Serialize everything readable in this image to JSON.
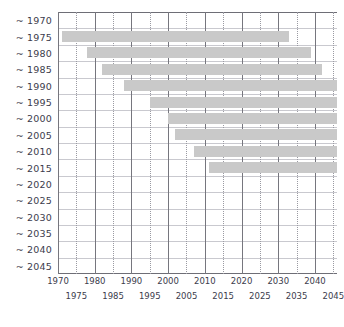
{
  "chart_data": {
    "type": "bar",
    "orientation": "horizontal",
    "title": "",
    "subtitle": "",
    "xlabel": "",
    "ylabel": "",
    "xlim": [
      1970,
      2046
    ],
    "grid": {
      "vertical_major_every": 10,
      "vertical_minor_every": 5,
      "horizontal": true
    },
    "legend": null,
    "bar_color": "#c9c9c9",
    "axis_color": "#6e6e76",
    "gridline_major_color": "#76767e",
    "gridline_minor_color": "#9a9aa2",
    "gridline_horizontal_color": "#c9c9cf",
    "categories": [
      "~ 1970",
      "~ 1975",
      "~ 1980",
      "~ 1985",
      "~ 1990",
      "~ 1995",
      "~ 2000",
      "~ 2005",
      "~ 2010",
      "~ 2015",
      "~ 2020",
      "~ 2025",
      "~ 2030",
      "~ 2035",
      "~ 2040",
      "~ 2045"
    ],
    "category_tilde_prefix": "~",
    "bars": [
      {
        "category": "~ 1970",
        "start": null,
        "end": null,
        "visible": false
      },
      {
        "category": "~ 1975",
        "start": 1971,
        "end": 2033,
        "visible": true
      },
      {
        "category": "~ 1980",
        "start": 1978,
        "end": 2039,
        "visible": true
      },
      {
        "category": "~ 1985",
        "start": 1982,
        "end": 2042,
        "visible": true
      },
      {
        "category": "~ 1990",
        "start": 1988,
        "end": 2046,
        "visible": true
      },
      {
        "category": "~ 1995",
        "start": 1995,
        "end": 2046,
        "visible": true
      },
      {
        "category": "~ 2000",
        "start": 2000,
        "end": 2046,
        "visible": true
      },
      {
        "category": "~ 2005",
        "start": 2002,
        "end": 2046,
        "visible": true
      },
      {
        "category": "~ 2010",
        "start": 2007,
        "end": 2046,
        "visible": true
      },
      {
        "category": "~ 2015",
        "start": 2011,
        "end": 2046,
        "visible": true
      },
      {
        "category": "~ 2020",
        "start": null,
        "end": null,
        "visible": false
      },
      {
        "category": "~ 2025",
        "start": null,
        "end": null,
        "visible": false
      },
      {
        "category": "~ 2030",
        "start": null,
        "end": null,
        "visible": false
      },
      {
        "category": "~ 2035",
        "start": null,
        "end": null,
        "visible": false
      },
      {
        "category": "~ 2040",
        "start": null,
        "end": null,
        "visible": false
      },
      {
        "category": "~ 2045",
        "start": null,
        "end": null,
        "visible": false
      }
    ],
    "xticks_major": [
      1970,
      1980,
      1990,
      2000,
      2010,
      2020,
      2030,
      2040
    ],
    "xticks_minor": [
      1975,
      1985,
      1995,
      2005,
      2015,
      2025,
      2035,
      2045
    ],
    "xticklabels_major": [
      "1970",
      "1980",
      "1990",
      "2000",
      "2010",
      "2020",
      "2030",
      "2040"
    ],
    "xticklabels_minor": [
      "1975",
      "1985",
      "1995",
      "2005",
      "2015",
      "2025",
      "2035",
      "2045"
    ]
  }
}
